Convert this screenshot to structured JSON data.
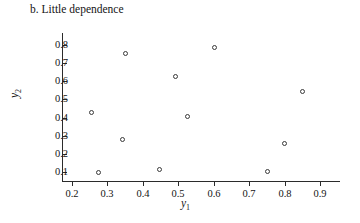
{
  "chart_data": {
    "type": "scatter",
    "title": "b. Little dependence",
    "xlabel": "y1",
    "ylabel": "y2",
    "xlabel_base": "y",
    "xlabel_sub": "1",
    "ylabel_base": "y",
    "ylabel_sub": "2",
    "grid": false,
    "legend": null,
    "xlim": [
      0.155,
      0.935
    ],
    "ylim": [
      0.045,
      0.855
    ],
    "xticks": [
      0.2,
      0.3,
      0.4,
      0.5,
      0.6,
      0.7,
      0.8,
      0.9
    ],
    "xtick_labels": [
      "0.2",
      "0.3",
      "0.4",
      "0.5",
      "0.6",
      "0.7",
      "0.8",
      "0.9"
    ],
    "yticks": [
      0.1,
      0.2,
      0.3,
      0.4,
      0.5,
      0.6,
      0.7,
      0.8
    ],
    "ytick_labels": [
      "0.1",
      "0.2",
      "0.3",
      "0.4",
      "0.5",
      "0.6",
      "0.7",
      "0.8"
    ],
    "marker": "open-circle",
    "marker_color": "#3a3a3a",
    "points": [
      {
        "x": 0.255,
        "y": 0.43
      },
      {
        "x": 0.275,
        "y": 0.1
      },
      {
        "x": 0.342,
        "y": 0.28
      },
      {
        "x": 0.352,
        "y": 0.755
      },
      {
        "x": 0.448,
        "y": 0.115
      },
      {
        "x": 0.492,
        "y": 0.625
      },
      {
        "x": 0.525,
        "y": 0.405
      },
      {
        "x": 0.602,
        "y": 0.785
      },
      {
        "x": 0.752,
        "y": 0.105
      },
      {
        "x": 0.8,
        "y": 0.255
      },
      {
        "x": 0.852,
        "y": 0.545
      }
    ]
  }
}
